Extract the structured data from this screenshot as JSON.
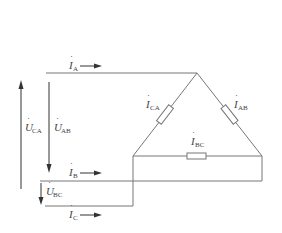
{
  "diagram": {
    "colors": {
      "wire": "#777777",
      "arrow": "#333333",
      "text": "#444444"
    },
    "labels": {
      "I_A": {
        "main": "I",
        "sub": "A"
      },
      "I_B": {
        "main": "I",
        "sub": "B"
      },
      "I_C": {
        "main": "I",
        "sub": "C"
      },
      "I_AB": {
        "main": "I",
        "sub": "AB"
      },
      "I_BC": {
        "main": "I",
        "sub": "BC"
      },
      "I_CA": {
        "main": "I",
        "sub": "CA"
      },
      "U_AB": {
        "main": "U",
        "sub": "AB"
      },
      "U_BC": {
        "main": "U",
        "sub": "BC"
      },
      "U_CA": {
        "main": "U",
        "sub": "CA"
      }
    },
    "dot_glyph": "·"
  }
}
